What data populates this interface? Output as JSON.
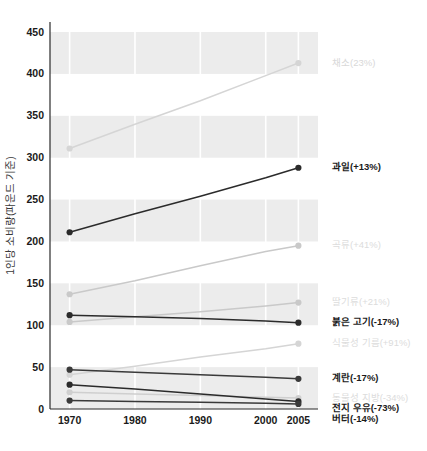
{
  "chart_data": {
    "type": "line",
    "title": "",
    "xlabel": "",
    "ylabel": "1인당 소비량(파운드 기준)",
    "x": [
      1970,
      1980,
      1990,
      2000,
      2005
    ],
    "xtick_labels": [
      "1970",
      "1980",
      "1990",
      "2000",
      "2005"
    ],
    "ytick_labels": [
      "0",
      "50",
      "100",
      "150",
      "200",
      "250",
      "300",
      "350",
      "400",
      "450"
    ],
    "yticks": [
      0,
      50,
      100,
      150,
      200,
      250,
      300,
      350,
      400,
      450
    ],
    "ylim": [
      0,
      462
    ],
    "xlim": [
      1967,
      2008
    ],
    "grid": "horizontal-bands",
    "legend_position": "right-inline",
    "series": [
      {
        "name": "채소",
        "label": "채소(23%)",
        "change": "23%",
        "color": "#d5d5d5",
        "label_color": "#d8d8d8",
        "values": [
          311,
          340,
          368,
          398,
          413
        ]
      },
      {
        "name": "과일",
        "label": "과일(+13%)",
        "change": "+13%",
        "color": "#2b2b2b",
        "label_color": "#1a1a1a",
        "values": [
          211,
          233,
          254,
          276,
          288
        ]
      },
      {
        "name": "곡류",
        "label": "곡류(+41%)",
        "change": "+41%",
        "color": "#c9c9c9",
        "label_color": "#dcdcdc",
        "values": [
          137,
          153,
          171,
          188,
          195
        ]
      },
      {
        "name": "딸기류",
        "label": "딸기류(+21%)",
        "change": "+21%",
        "color": "#c9c9c9",
        "label_color": "#dcdcdc",
        "values": [
          104,
          110,
          116,
          123,
          127
        ]
      },
      {
        "name": "붉은 고기",
        "label": "붉은 고기(-17%)",
        "change": "-17%",
        "color": "#2b2b2b",
        "label_color": "#1a1a1a",
        "values": [
          112,
          110,
          108,
          105,
          103
        ]
      },
      {
        "name": "식물성 기름",
        "label": "식물성 기름(+91%)",
        "change": "+91%",
        "color": "#d5d5d5",
        "label_color": "#dcdcdc",
        "values": [
          41,
          51,
          62,
          72,
          78
        ]
      },
      {
        "name": "계란",
        "label": "계란(-17%)",
        "change": "-17%",
        "color": "#3a3a3a",
        "label_color": "#1a1a1a",
        "values": [
          47,
          44,
          41,
          38,
          36
        ]
      },
      {
        "name": "동물성 지방",
        "label": "동물성 지방(-34%)",
        "change": "-34%",
        "color": "#cfcfcf",
        "label_color": "#dcdcdc",
        "values": [
          20,
          18,
          16,
          14,
          13
        ]
      },
      {
        "name": "전지 우유",
        "label": "전지 우유(-73%)",
        "change": "-73%",
        "color": "#2b2b2b",
        "label_color": "#1a1a1a",
        "values": [
          29,
          24,
          18,
          12,
          9
        ]
      },
      {
        "name": "버터",
        "label": "버터(-14%)",
        "change": "-14%",
        "color": "#3a3a3a",
        "label_color": "#1a1a1a",
        "values": [
          10,
          9,
          8,
          7,
          6
        ]
      }
    ]
  }
}
